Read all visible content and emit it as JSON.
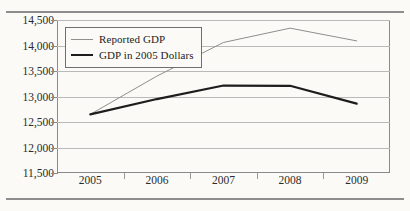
{
  "chart_data": {
    "type": "line",
    "title": "",
    "xlabel": "",
    "ylabel": "",
    "x": [
      "2005",
      "2006",
      "2007",
      "2008",
      "2009"
    ],
    "categories": [
      "2005",
      "2006",
      "2007",
      "2008",
      "2009"
    ],
    "ylim": [
      11500,
      14500
    ],
    "yticks": [
      "11,500",
      "12,000",
      "12,500",
      "13,000",
      "13,500",
      "14,000",
      "14,500"
    ],
    "ytick_values": [
      11500,
      12000,
      12500,
      13000,
      13500,
      14000,
      14500
    ],
    "grid": true,
    "legend_position": "top-left",
    "series": [
      {
        "name": "Reported GDP",
        "values": [
          12650,
          13400,
          14060,
          14340,
          14090
        ],
        "color": "#8e8e8e",
        "width": "thin"
      },
      {
        "name": "GDP in 2005 Dollars",
        "values": [
          12650,
          12950,
          13215,
          13210,
          12860
        ],
        "color": "#1d1d1d",
        "width": "thick"
      }
    ]
  },
  "legend": {
    "items": [
      {
        "label": "Reported GDP",
        "style": "thin"
      },
      {
        "label": "GDP in 2005 Dollars",
        "style": "thick"
      }
    ]
  },
  "rules": {
    "top": "horizontal-rule",
    "bottom": "horizontal-rule"
  }
}
